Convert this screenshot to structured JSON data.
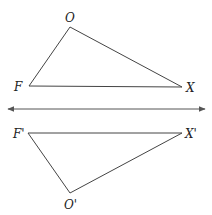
{
  "diagram": {
    "original": {
      "labels": {
        "O": "O",
        "F": "F",
        "X": "X"
      }
    },
    "image": {
      "labels": {
        "O": "O'",
        "F": "F'",
        "X": "X'"
      }
    },
    "mirror_line": {
      "type": "double-arrow line",
      "color": "#555555"
    }
  }
}
